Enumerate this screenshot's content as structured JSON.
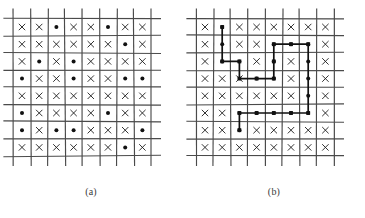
{
  "figure": {
    "panels": [
      {
        "id": "a",
        "caption": "(a)",
        "rows": 8,
        "cols": 8,
        "marks": [
          [
            "x",
            "x",
            "dot",
            "x",
            "x",
            "dot",
            "x",
            "x"
          ],
          [
            "x",
            "x",
            "x",
            "x",
            "x",
            "x",
            "dot",
            "x"
          ],
          [
            "x",
            "dot",
            "x",
            "dot",
            "x",
            "x",
            "x",
            "x"
          ],
          [
            "dot",
            "x",
            "x",
            "dot",
            "x",
            "x",
            "dot",
            "dot"
          ],
          [
            "x",
            "x",
            "x",
            "x",
            "x",
            "x",
            "x",
            "x"
          ],
          [
            "dot",
            "x",
            "x",
            "x",
            "x",
            "dot",
            "x",
            "x"
          ],
          [
            "dot",
            "x",
            "dot",
            "dot",
            "x",
            "x",
            "x",
            "dot"
          ],
          [
            "x",
            "x",
            "x",
            "x",
            "x",
            "x",
            "dot",
            "x"
          ]
        ],
        "path": []
      },
      {
        "id": "b",
        "caption": "(b)",
        "rows": 8,
        "cols": 8,
        "marks": [
          [
            "x",
            "dot",
            "x",
            "x",
            "x",
            "x",
            "x",
            "x"
          ],
          [
            "x",
            "dot",
            "x",
            "x",
            "dot",
            "dot",
            "dot",
            "x"
          ],
          [
            "x",
            "dot",
            "dot",
            "x",
            "dot",
            "x",
            "dot",
            "x"
          ],
          [
            "x",
            "x",
            "x",
            "dot",
            "dot",
            "x",
            "dot",
            "x"
          ],
          [
            "x",
            "x",
            "x",
            "x",
            "x",
            "x",
            "dot",
            "x"
          ],
          [
            "x",
            "x",
            "dot",
            "dot",
            "dot",
            "dot",
            "dot",
            "x"
          ],
          [
            "x",
            "x",
            "dot",
            "x",
            "x",
            "x",
            "x",
            "x"
          ],
          [
            "x",
            "x",
            "x",
            "x",
            "x",
            "x",
            "x",
            "x"
          ]
        ],
        "path": [
          {
            "r": 0,
            "c": 1
          },
          {
            "r": 2,
            "c": 1
          },
          {
            "r": 2,
            "c": 2
          },
          {
            "r": 3,
            "c": 2
          },
          {
            "r": 3,
            "c": 3
          },
          {
            "r": 3,
            "c": 4
          },
          {
            "r": 2,
            "c": 4
          },
          {
            "r": 1,
            "c": 4
          },
          {
            "r": 1,
            "c": 5
          },
          {
            "r": 1,
            "c": 6
          },
          {
            "r": 5,
            "c": 6
          },
          {
            "r": 5,
            "c": 5
          },
          {
            "r": 5,
            "c": 4
          },
          {
            "r": 5,
            "c": 3
          },
          {
            "r": 5,
            "c": 2
          },
          {
            "r": 6,
            "c": 2
          }
        ]
      }
    ],
    "style": {
      "grid_color": "#4a4a4a",
      "mark_color": "#111111",
      "path_color": "#111111",
      "background": "#ffffff"
    },
    "geometry": {
      "cell": 17.2,
      "origin_x": 22,
      "origin_y": 27,
      "grid_overhang": 10,
      "x_size": 3.2,
      "dot_radius": 2.0,
      "gridline_jitter": 1.6
    }
  }
}
